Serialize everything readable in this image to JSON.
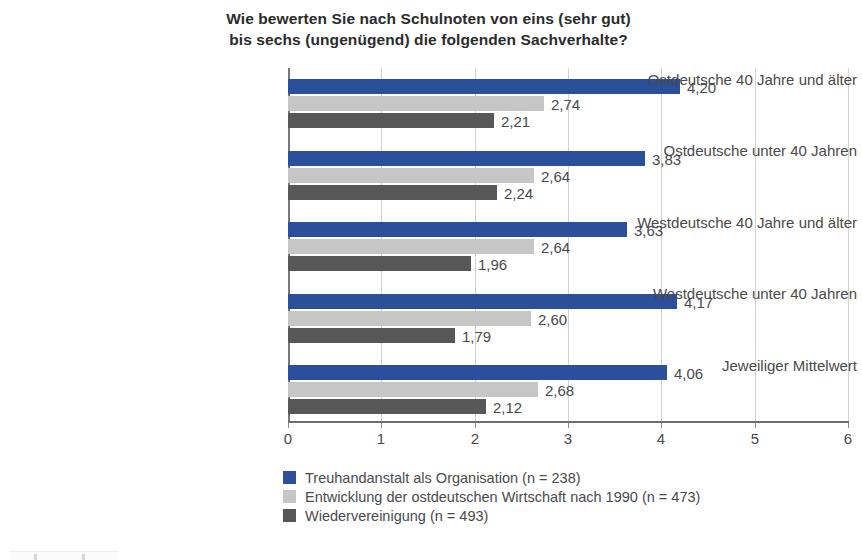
{
  "chart_data": {
    "type": "bar",
    "orientation": "horizontal",
    "title": "Wie bewerten Sie nach Schulnoten von eins (sehr gut) bis sechs (ungenügend) die folgenden Sachverhalte?",
    "title_lines": [
      "Wie bewerten Sie nach Schulnoten von eins (sehr gut)",
      "bis sechs (ungenügend) die folgenden Sachverhalte?"
    ],
    "xlabel": "",
    "ylabel": "",
    "xlim": [
      0,
      6
    ],
    "xticks": [
      "0",
      "1",
      "2",
      "3",
      "4",
      "5",
      "6"
    ],
    "grid": true,
    "legend_position": "bottom-left",
    "categories": [
      "Ostdeutsche 40 Jahre und älter",
      "Ostdeutsche unter 40 Jahren",
      "Westdeutsche 40 Jahre und älter",
      "Westdeutsche unter 40 Jahren",
      "Jeweiliger Mittelwert"
    ],
    "series": [
      {
        "name": "Treuhandanstalt als Organisation (n = 238)",
        "color": "#2c4f9c",
        "values": [
          4.2,
          3.83,
          3.63,
          4.17,
          4.06
        ],
        "labels": [
          "4,20",
          "3,83",
          "3,63",
          "4,17",
          "4,06"
        ]
      },
      {
        "name": "Entwicklung der ostdeutschen Wirtschaft nach 1990 (n = 473)",
        "color": "#c6c6c6",
        "values": [
          2.74,
          2.64,
          2.64,
          2.6,
          2.68
        ],
        "labels": [
          "2,74",
          "2,64",
          "2,64",
          "2,60",
          "2,68"
        ]
      },
      {
        "name": "Wiedervereinigung (n = 493)",
        "color": "#575757",
        "values": [
          2.21,
          2.24,
          1.96,
          1.79,
          2.12
        ],
        "labels": [
          "2,21",
          "2,24",
          "1,96",
          "1,79",
          "2,12"
        ]
      }
    ]
  },
  "legend": {
    "entries": [
      "Treuhandanstalt als Organisation (n = 238)",
      "Entwicklung der ostdeutschen Wirtschaft nach 1990 (n = 473)",
      "Wiedervereinigung (n = 493)"
    ]
  },
  "colors": {
    "series_blue": "#2c4f9c",
    "series_light_gray": "#c6c6c6",
    "series_dark_gray": "#575757",
    "axis": "#6e6e6e",
    "grid": "#d2d2d6",
    "text": "#4a4a4a",
    "background": "#ffffff"
  }
}
